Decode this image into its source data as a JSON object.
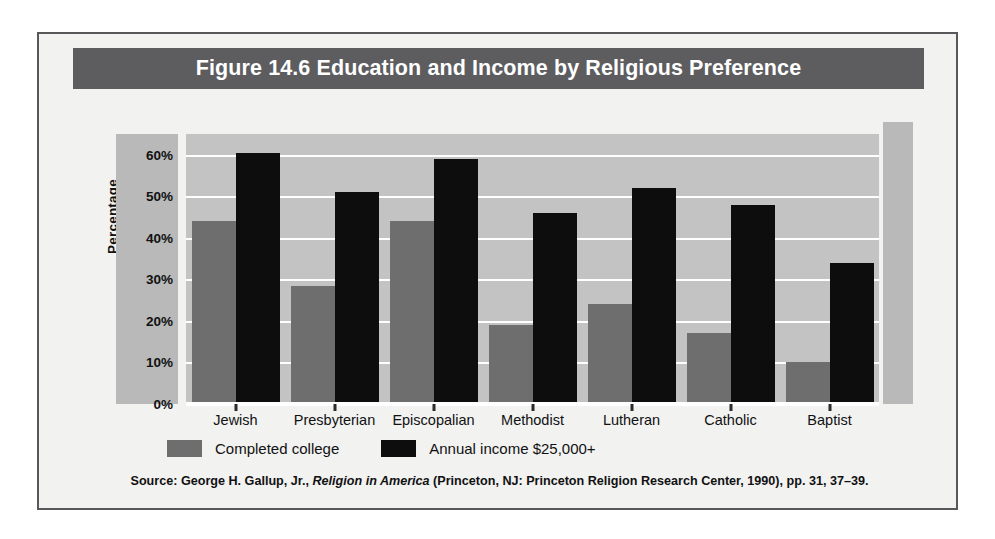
{
  "figure": {
    "title": "Figure 14.6  Education and Income by Religious Preference",
    "title_bg": "#5d5d5f",
    "frame_bg": "#f2f2f1",
    "frame_border": "#58585a"
  },
  "source": {
    "prefix": "Source: George H. Gallup, Jr., ",
    "italic_title": "Religion in America",
    "suffix": " (Princeton, NJ: Princeton Religion Research Center, 1990), pp. 31, 37–39."
  },
  "legend": {
    "items": [
      {
        "label": "Completed college",
        "color": "#6e6e6e",
        "swatch_name": "legend-swatch-completed-college"
      },
      {
        "label": "Annual income $25,000+",
        "color": "#0d0d0d",
        "swatch_name": "legend-swatch-annual-income"
      }
    ]
  },
  "axis": {
    "y_title": "Percentage",
    "y_ticks": [
      "0%",
      "10%",
      "20%",
      "30%",
      "40%",
      "50%",
      "60%"
    ]
  },
  "chart_data": {
    "type": "bar",
    "title": "Figure 14.6  Education and Income by Religious Preference",
    "xlabel": "",
    "ylabel": "Percentage",
    "ylim": [
      0,
      65
    ],
    "ytick_values": [
      0,
      10,
      20,
      30,
      40,
      50,
      60
    ],
    "ytick_labels": [
      "0%",
      "10%",
      "20%",
      "30%",
      "40%",
      "50%",
      "60%"
    ],
    "grid": true,
    "legend_position": "below-plot-left",
    "categories": [
      "Jewish",
      "Presbyterian",
      "Episcopalian",
      "Methodist",
      "Lutheran",
      "Catholic",
      "Baptist"
    ],
    "series": [
      {
        "name": "Completed college",
        "color": "#6e6e6e",
        "values": [
          44,
          28.5,
          44,
          19,
          24,
          17,
          10
        ]
      },
      {
        "name": "Annual income $25,000+",
        "color": "#0d0d0d",
        "values": [
          60.5,
          51,
          59,
          46,
          52,
          48,
          34
        ]
      }
    ],
    "plot_bg": "#c3c3c3",
    "gridline_color": "#ffffff"
  }
}
